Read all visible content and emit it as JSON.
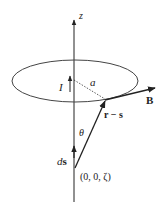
{
  "diagram": {
    "type": "physics-vector-diagram",
    "axis": {
      "label": "z"
    },
    "loop": {
      "current_label": "I",
      "radius_label": "a"
    },
    "vectors": {
      "field": {
        "label": "B"
      },
      "displacement": {
        "label": "r − s"
      },
      "element": {
        "label_prefix": "d",
        "label_vec": "s"
      }
    },
    "angle": {
      "label": "θ"
    },
    "point": {
      "label": "(0, 0, ζ)"
    },
    "colors": {
      "stroke": "#222222",
      "background": "#ffffff"
    }
  }
}
